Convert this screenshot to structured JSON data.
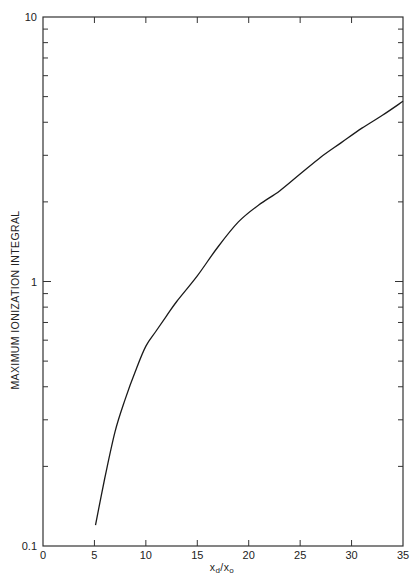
{
  "chart_data": {
    "type": "line",
    "title": "",
    "xlabel": "x_d/x_o",
    "xlabel_main": "x",
    "xlabel_sub1": "d",
    "xlabel_sep": "/x",
    "xlabel_sub2": "o",
    "ylabel": "MAXIMUM IONIZATION INTEGRAL",
    "xlim": [
      0,
      35
    ],
    "ylim": [
      0.1,
      10
    ],
    "yscale": "log",
    "grid": false,
    "legend": null,
    "x_ticks": [
      0,
      5,
      10,
      15,
      20,
      25,
      30,
      35
    ],
    "x_tick_labels": [
      "0",
      "5",
      "10",
      "15",
      "20",
      "25",
      "30",
      "35"
    ],
    "y_tick_labels": [
      "0.1",
      "1",
      "10"
    ],
    "series": [
      {
        "name": "Maximum ionization integral",
        "x": [
          5.1,
          6,
          7,
          8,
          9,
          10,
          11,
          12,
          13,
          15,
          17,
          19,
          21,
          23,
          25,
          27,
          29,
          31,
          33,
          35
        ],
        "y": [
          0.12,
          0.18,
          0.27,
          0.36,
          0.46,
          0.57,
          0.65,
          0.74,
          0.84,
          1.05,
          1.35,
          1.68,
          1.95,
          2.2,
          2.55,
          2.95,
          3.35,
          3.8,
          4.25,
          4.8
        ]
      }
    ]
  },
  "style": {
    "line_color": "#1a1a1a",
    "axis_color": "#333333",
    "background": "#ffffff"
  }
}
